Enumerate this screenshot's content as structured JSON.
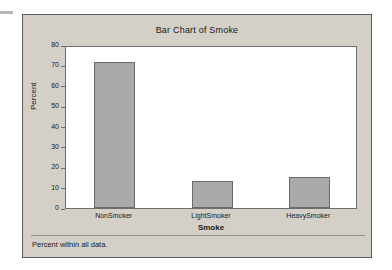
{
  "chart_data": {
    "type": "bar",
    "title": "Bar Chart of Smoke",
    "xlabel": "Smoke",
    "ylabel": "Percent",
    "categories": [
      "NonSmoker",
      "LightSmoker",
      "HeavySmoker"
    ],
    "values": [
      71.5,
      13.5,
      15.3
    ],
    "ylim": [
      0,
      80
    ],
    "yticks": [
      0,
      10,
      20,
      30,
      40,
      50,
      60,
      70,
      80
    ],
    "ytick_labels": [
      "0",
      "10",
      "20",
      "30",
      "40",
      "50",
      "60",
      "70",
      "80"
    ],
    "grid": false,
    "legend": false,
    "footnote": "Percent within all data.",
    "bar_fill_color": "#a9a9a9",
    "bar_border_color": "#6a6a6a",
    "panel_color": "#d4d0c8",
    "plot_background": "#ffffff",
    "axis_color": "#6e6e6e"
  }
}
